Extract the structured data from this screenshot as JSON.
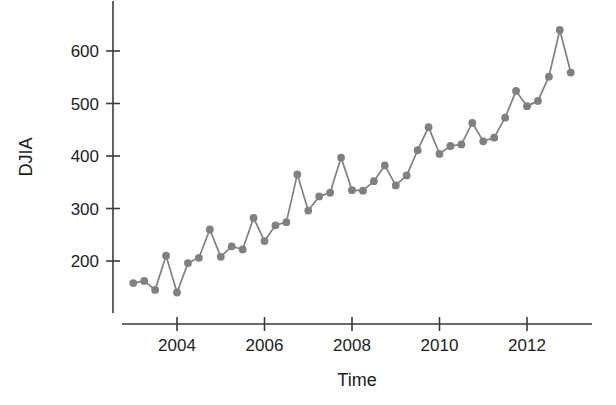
{
  "chart_data": {
    "type": "line",
    "title": "",
    "subtitle": "",
    "xlabel": "Time",
    "ylabel": "DJIA",
    "grid": false,
    "legend": null,
    "marker": "filled-circle",
    "series_color": "#808080",
    "axis_color": "#3a3a3a",
    "xlim": [
      2002.9,
      2013.2
    ],
    "ylim": [
      120,
      680
    ],
    "xticks": [
      2004,
      2006,
      2008,
      2010,
      2012
    ],
    "xtick_labels": [
      "2004",
      "2006",
      "2008",
      "2010",
      "2012"
    ],
    "yticks": [
      200,
      300,
      400,
      500,
      600
    ],
    "ytick_labels": [
      "200",
      "300",
      "400",
      "500",
      "600"
    ],
    "x": [
      2003.0,
      2003.25,
      2003.5,
      2003.75,
      2004.0,
      2004.25,
      2004.5,
      2004.75,
      2005.0,
      2005.25,
      2005.5,
      2005.75,
      2006.0,
      2006.25,
      2006.5,
      2006.75,
      2007.0,
      2007.25,
      2007.5,
      2007.75,
      2008.0,
      2008.25,
      2008.5,
      2008.75,
      2009.0,
      2009.25,
      2009.5,
      2009.75,
      2010.0,
      2010.25,
      2010.5,
      2010.75,
      2011.0,
      2011.25,
      2011.5,
      2011.75,
      2012.0,
      2012.25,
      2012.5,
      2012.75,
      2013.0
    ],
    "values": [
      158,
      162,
      145,
      210,
      140,
      196,
      206,
      260,
      208,
      228,
      222,
      282,
      238,
      268,
      274,
      365,
      296,
      323,
      330,
      397,
      335,
      334,
      352,
      382,
      344,
      363,
      411,
      455,
      404,
      419,
      422,
      463,
      428,
      435,
      473,
      524,
      495,
      505,
      551,
      640,
      559
    ],
    "series_name": "DJIA",
    "point_count": 41,
    "frequency": "quarterly"
  }
}
